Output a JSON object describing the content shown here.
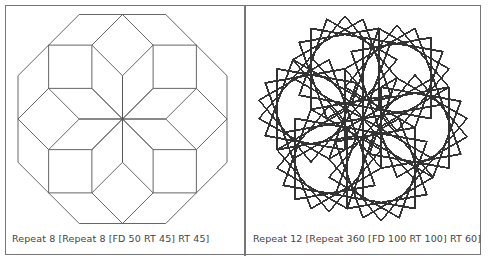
{
  "panels": [
    {
      "id": "left",
      "caption": "Repeat 8 [Repeat 8 [FD 50 RT 45] RT 45]",
      "program": {
        "outer": 8,
        "inner": 8,
        "fd": 50,
        "rt_inner": 45,
        "rt_outer": 45
      },
      "fit_box": {
        "x": 18,
        "y": 14,
        "w": 209,
        "h": 210
      },
      "stroke": "#555555",
      "stroke_width": 0.9
    },
    {
      "id": "right",
      "caption": "Repeat 12 [Repeat 360 [FD 100 RT 100] RT 60]",
      "program": {
        "outer": 12,
        "inner": 360,
        "fd": 100,
        "rt_inner": 100,
        "rt_outer": 60
      },
      "fit_box": {
        "x": 259,
        "y": 13,
        "w": 208,
        "h": 211
      },
      "stroke": "#333333",
      "stroke_width": 0.8
    }
  ],
  "colors": {
    "frame": "#777777",
    "caption": "#444444",
    "background": "#ffffff"
  }
}
